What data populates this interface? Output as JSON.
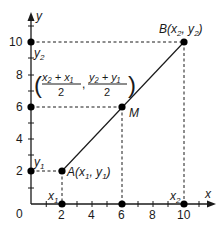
{
  "diagram": {
    "axes": {
      "x_label": "x",
      "y_label": "y",
      "origin_label": "0",
      "x_ticks": [
        "2",
        "4",
        "6",
        "8",
        "10"
      ],
      "y_ticks": [
        "2",
        "4",
        "6",
        "8",
        "10"
      ],
      "x_range": [
        0,
        11
      ],
      "y_range": [
        0,
        11
      ]
    },
    "points": {
      "A": {
        "name": "A",
        "label_prefix": "A(x",
        "sub1": "1",
        "mid": ", y",
        "sub2": "1",
        "suffix": ")",
        "x": 2,
        "y": 2
      },
      "B": {
        "name": "B",
        "label_prefix": "B(x",
        "sub1": "2",
        "mid": ", y",
        "sub2": "2",
        "suffix": ")",
        "x": 10,
        "y": 10
      },
      "M": {
        "name": "M",
        "label": "M",
        "x": 6,
        "y": 6
      }
    },
    "axis_point_labels": {
      "x1": {
        "base": "x",
        "sub": "1"
      },
      "x2": {
        "base": "x",
        "sub": "2"
      },
      "y1": {
        "base": "y",
        "sub": "1"
      },
      "y2": {
        "base": "y",
        "sub": "2"
      }
    },
    "midpoint_formula": {
      "open": "(",
      "num_x": "x₂ + x₁",
      "den_x": "2",
      "comma": ",",
      "num_y": "y₂ + y₁",
      "den_y": "2",
      "close": ")"
    },
    "colors": {
      "line": "#1a1a1a",
      "point": "#000000",
      "dashed": "#1a1a1a",
      "background": "#ffffff"
    }
  }
}
